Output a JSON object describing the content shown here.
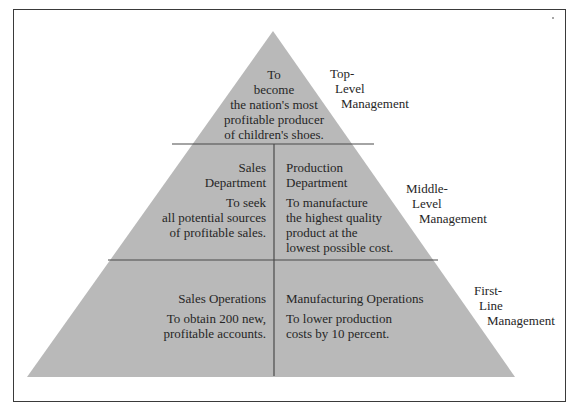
{
  "diagram": {
    "type": "pyramid",
    "colors": {
      "fill": "#b9b9b9",
      "divider": "#4a4a4a",
      "text": "#262626",
      "frame": "#3a3a3a"
    },
    "top": {
      "goal_lines": [
        "To",
        "become",
        "the nation's most",
        "profitable producer",
        "of children's shoes."
      ]
    },
    "middle": {
      "left": {
        "title_lines": [
          "Sales",
          "Department"
        ],
        "goal_lines": [
          "To seek",
          "all potential sources",
          "of profitable sales."
        ]
      },
      "right": {
        "title_lines": [
          "Production",
          "Department"
        ],
        "goal_lines": [
          "To manufacture",
          "the highest quality",
          "product at the",
          "lowest possible cost."
        ]
      }
    },
    "bottom": {
      "left": {
        "title": "Sales Operations",
        "goal_lines": [
          "To obtain 200 new,",
          "profitable accounts."
        ]
      },
      "right": {
        "title": "Manufacturing Operations",
        "goal_lines": [
          "To lower production",
          "costs by 10 percent."
        ]
      }
    },
    "levels": [
      {
        "lines": [
          "Top-",
          "Level",
          "Management"
        ]
      },
      {
        "lines": [
          "Middle-",
          "Level",
          "Management"
        ]
      },
      {
        "lines": [
          "First-",
          "Line",
          "Management"
        ]
      }
    ]
  }
}
